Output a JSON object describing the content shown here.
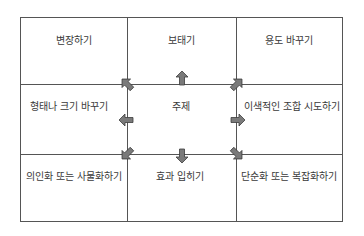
{
  "diagram": {
    "type": "3x3 idea grid",
    "center": "주제",
    "cells": {
      "top_left": "변장하기",
      "top_center": "보태기",
      "top_right": "용도 바꾸기",
      "middle_left": "형태나 크기 바꾸기",
      "middle_right": "이색적인 조합 시도하기",
      "bottom_left": "의인화 또는 사물화하기",
      "bottom_center": "효과 입히기",
      "bottom_right": "단순화 또는 복잡화하기"
    },
    "arrows": [
      "up-left",
      "up",
      "up-right",
      "left",
      "right",
      "down-left",
      "down",
      "down-right"
    ],
    "colors": {
      "line": "#555555",
      "arrow_fill": "#7a7a7a",
      "arrow_stroke": "#3c3c3c",
      "text": "#3a3a3a"
    }
  }
}
